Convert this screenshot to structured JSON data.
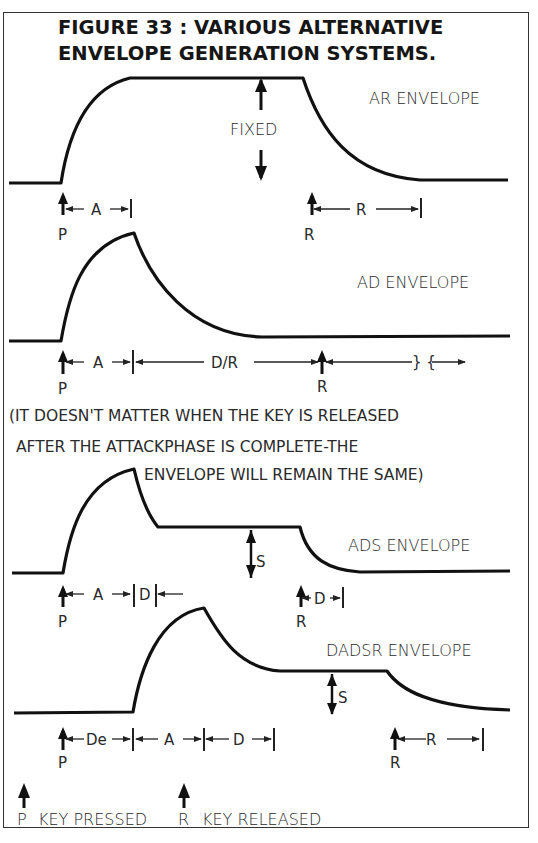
{
  "figure": {
    "title_line1": "FIGURE 33 : VARIOUS ALTERNATIVE",
    "title_line2": "ENVELOPE GENERATION SYSTEMS."
  },
  "envelopes": {
    "ar": {
      "name": "AR ENVELOPE",
      "fixed": "FIXED",
      "a": "A",
      "r": "R",
      "p_mark": "P",
      "r_mark": "R"
    },
    "ad": {
      "name": "AD ENVELOPE",
      "a": "A",
      "dr": "D/R",
      "p_mark": "P",
      "r_mark": "R"
    },
    "note": {
      "line1": "(IT DOESN'T MATTER WHEN THE KEY IS RELEASED",
      "line2": "AFTER THE ATTACKPHASE IS COMPLETE-THE",
      "line3": "ENVELOPE WILL REMAIN THE SAME)"
    },
    "ads": {
      "name": "ADS ENVELOPE",
      "a": "A",
      "d": "D",
      "s": "S",
      "d2": "D",
      "p_mark": "P",
      "r_mark": "R"
    },
    "dadsr": {
      "name": "DADSR ENVELOPE",
      "de": "De",
      "a": "A",
      "d": "D",
      "s": "S",
      "r": "R",
      "p_mark": "P",
      "r_mark": "R"
    }
  },
  "legend": {
    "p": "P",
    "p_text": "KEY PRESSED",
    "r": "R",
    "r_text": "KEY RELEASED"
  }
}
